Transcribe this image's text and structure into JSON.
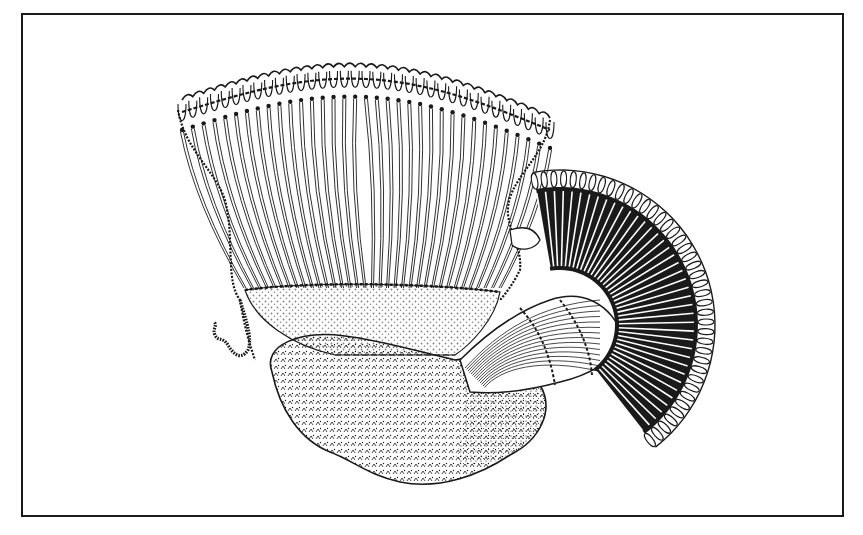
{
  "figure": {
    "kind": "scientific line illustration",
    "style": "black ink engraving on white",
    "colors": {
      "ink": "#1a1a1a",
      "paper": "#ffffff"
    },
    "frame": {
      "x": 21,
      "y": 13,
      "width": 823,
      "height": 504
    },
    "elements": [
      {
        "name": "large-funnel",
        "description": "wide flaring cup of radiating fibres with scalloped rim",
        "rim_lobes": 34
      },
      {
        "name": "small-fan",
        "description": "dark radiating fan with dense striations",
        "rays": 40
      },
      {
        "name": "connecting-stalk",
        "description": "striated band joining the fan to the base mass"
      },
      {
        "name": "basal-mass",
        "description": "stippled and hatched lobed body"
      },
      {
        "name": "wavy-filament",
        "description": "beaded thread hanging at the left"
      }
    ]
  }
}
